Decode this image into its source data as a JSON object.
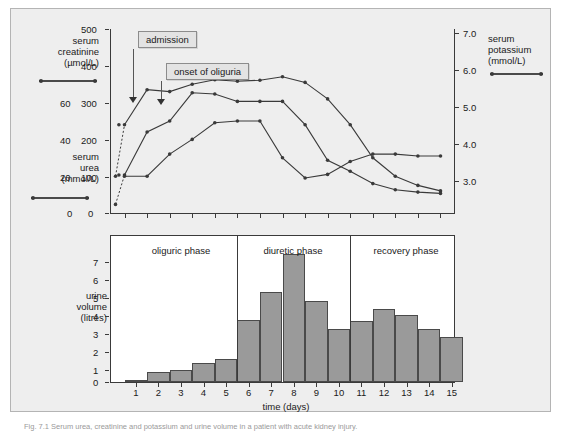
{
  "figure": {
    "caption": "Fig. 7.1 Serum urea, creatinine and potassium and urine volume in a patient with acute kidney injury."
  },
  "axes": {
    "creatinine": {
      "label_lines": [
        "serum",
        "creatinine",
        "(µmol/L)"
      ],
      "ticks": [
        "500",
        "400",
        "300",
        "200",
        "100",
        "0"
      ],
      "unit": "µmol/L",
      "range": [
        0,
        500
      ]
    },
    "urea": {
      "label_lines": [
        "serum",
        "urea",
        "(mmol/L)"
      ],
      "ticks": [
        "60",
        "40",
        "20",
        "0"
      ],
      "unit": "mmol/L",
      "range": [
        0,
        75
      ]
    },
    "potassium": {
      "label_lines": [
        "serum",
        "potassium",
        "(mmol/L)"
      ],
      "ticks": [
        "7.0",
        "6.0",
        "5.0",
        "4.0",
        "3.0"
      ],
      "unit": "mmol/L",
      "range": [
        2.4,
        7.4
      ]
    },
    "urine": {
      "label_lines": [
        "urine",
        "volume",
        "(litres)"
      ],
      "ticks": [
        "7",
        "6",
        "5",
        "4",
        "3",
        "2",
        "1",
        "0"
      ],
      "unit": "litres",
      "range": [
        0,
        7.6
      ]
    },
    "time": {
      "label": "time (days)",
      "ticks": [
        "1",
        "2",
        "3",
        "4",
        "5",
        "6",
        "7",
        "8",
        "9",
        "10",
        "11",
        "12",
        "13",
        "14",
        "15"
      ]
    }
  },
  "annotations": [
    {
      "text": "admission",
      "day": 1.0
    },
    {
      "text": "onset of oliguria",
      "day": 2.0
    }
  ],
  "phases": [
    {
      "label": "oliguric phase",
      "start": 0.4,
      "end": 5.5
    },
    {
      "label": "diuretic phase",
      "start": 5.5,
      "end": 10.5
    },
    {
      "label": "recovery phase",
      "start": 10.5,
      "end": 15.6
    }
  ],
  "colors": {
    "panel": "#eeeeee",
    "plot_background": "#ffffff",
    "axis": "#3a3a3a",
    "series": "#3a3a3a",
    "bar_fill": "#9a9a9a",
    "bar_stroke": "#4a4a4a",
    "callout_fill": "#e3e3e3",
    "callout_border": "#8c8c8c"
  },
  "chart_data": [
    {
      "type": "line",
      "title": "",
      "xlabel": "time (days)",
      "ylabel": "serum creatinine (µmol/L) / serum urea (mmol/L)",
      "y2label": "serum potassium (mmol/L)",
      "grid": false,
      "legend": "axis-side keys",
      "x": [
        1,
        2,
        3,
        4,
        5,
        6,
        7,
        8,
        9,
        10,
        11,
        12,
        13,
        14,
        15
      ],
      "xlim": [
        0.4,
        15.6
      ],
      "ylim": [
        0,
        500
      ],
      "y2lim": [
        2.4,
        7.4
      ],
      "series": [
        {
          "name": "serum creatinine",
          "unit": "µmol/L",
          "axis": "left-creatinine",
          "dashed_lead_in": true,
          "values": [
            240,
            335,
            330,
            350,
            362,
            358,
            361,
            370,
            355,
            310,
            240,
            150,
            100,
            75,
            60
          ]
        },
        {
          "name": "serum urea",
          "unit": "mmol/L",
          "axis": "left-urea",
          "dashed_lead_in": true,
          "values": [
            15.5,
            33,
            37.5,
            49,
            48.5,
            45.5,
            45.5,
            45.5,
            36,
            21.5,
            17,
            12,
            9.5,
            8.5,
            8
          ]
        },
        {
          "name": "serum potassium",
          "unit": "mmol/L",
          "axis": "right-potassium",
          "dashed_lead_in": false,
          "values": [
            3.4,
            3.4,
            4.0,
            4.4,
            4.85,
            4.9,
            4.9,
            3.9,
            3.35,
            3.45,
            3.8,
            4.0,
            4.0,
            3.95,
            3.95
          ]
        }
      ]
    },
    {
      "type": "bar",
      "title": "",
      "xlabel": "time (days)",
      "ylabel": "urine volume (litres)",
      "grid": false,
      "categories": [
        "1",
        "2",
        "3",
        "4",
        "5",
        "6",
        "7",
        "8",
        "9",
        "10",
        "11",
        "12",
        "13",
        "14",
        "15"
      ],
      "values": [
        0.05,
        0.5,
        0.65,
        1.0,
        1.2,
        3.25,
        4.7,
        6.65,
        4.2,
        2.75,
        3.2,
        3.8,
        3.5,
        2.75,
        2.35
      ],
      "ylim": [
        0,
        7.6
      ]
    }
  ]
}
